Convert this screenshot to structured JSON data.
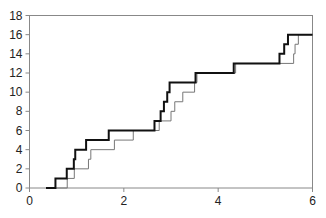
{
  "chart_data": {
    "type": "line",
    "subtype": "step",
    "title": "",
    "xlabel": "",
    "ylabel": "",
    "xlim": [
      0,
      6
    ],
    "ylim": [
      0,
      18
    ],
    "x_ticks": [
      0,
      2,
      4,
      6
    ],
    "y_ticks": [
      0,
      2,
      4,
      6,
      8,
      10,
      12,
      14,
      16,
      18
    ],
    "grid": false,
    "legend": null,
    "series": [
      {
        "name": "Series 1 (dark)",
        "color": "#111111",
        "width": 2,
        "x": [
          0.35,
          0.55,
          0.79,
          0.94,
          0.97,
          1.2,
          1.68,
          2.65,
          2.78,
          2.85,
          2.92,
          2.97,
          3.52,
          4.33,
          5.3,
          5.4,
          5.48,
          6.0
        ],
        "y": [
          0,
          1,
          2,
          3,
          4,
          5,
          6,
          7,
          8,
          9,
          10,
          11,
          12,
          13,
          14,
          15,
          16,
          16
        ]
      },
      {
        "name": "Series 2 (light)",
        "color": "#777777",
        "width": 1,
        "x": [
          0.35,
          0.8,
          0.95,
          1.25,
          1.3,
          1.8,
          2.2,
          2.75,
          3.0,
          3.08,
          3.25,
          3.5,
          3.55,
          4.37,
          5.6,
          5.63,
          5.7,
          6.0
        ],
        "y": [
          0,
          1,
          2,
          3,
          4,
          5,
          6,
          7,
          8,
          9,
          10,
          11,
          12,
          13,
          14,
          15,
          16,
          16
        ]
      }
    ]
  },
  "axes": {
    "x_tick_labels": [
      "0",
      "2",
      "4",
      "6"
    ],
    "y_tick_labels": [
      "0",
      "2",
      "4",
      "6",
      "8",
      "10",
      "12",
      "14",
      "16",
      "18"
    ]
  }
}
